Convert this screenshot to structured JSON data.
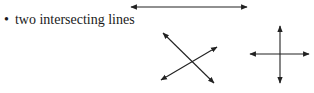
{
  "bullet": {
    "symbol": "•",
    "text": "two intersecting lines"
  },
  "figures": {
    "line_color": "#222222",
    "top_line": {
      "description": "single line with arrows on both ends"
    },
    "oblique_intersection": {
      "description": "two lines intersecting at an oblique angle"
    },
    "perpendicular_intersection": {
      "description": "two perpendicular lines intersecting"
    }
  }
}
